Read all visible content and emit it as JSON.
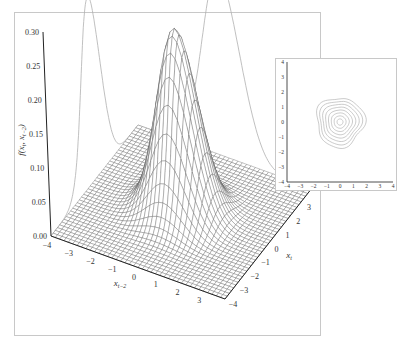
{
  "chart_data": [
    {
      "type": "surface3d",
      "title": "",
      "zlabel": "f(x_t, x_{t-2})",
      "xlabel": "x_{t-2}",
      "ylabel": "x_t",
      "x_range": [
        -4,
        4
      ],
      "y_range": [
        -4,
        4
      ],
      "z_range": [
        0.0,
        0.3
      ],
      "x_ticks": [
        -4,
        -3,
        -2,
        -1,
        0,
        1,
        2,
        3
      ],
      "y_ticks": [
        -4,
        -3,
        -2,
        -1,
        0,
        1,
        2,
        3
      ],
      "z_ticks": [
        "0.00",
        "0.05",
        "0.10",
        "0.15",
        "0.20",
        "0.25",
        "0.30"
      ],
      "surface": {
        "distribution": "bivariate normal-like density",
        "peak_value": 0.27,
        "peak_location": [
          0,
          0
        ],
        "sigma_x": 0.85,
        "sigma_y": 0.85
      },
      "grid_resolution": 40,
      "back_wall_projections": [
        {
          "name": "marginal projection on x_{t-2} wall",
          "peak_value": 0.27
        },
        {
          "name": "marginal projection on x_t wall",
          "peak_value": 0.27
        }
      ],
      "grid": false
    },
    {
      "type": "contour",
      "title": "",
      "x_range": [
        -4,
        4
      ],
      "y_range": [
        -4,
        4
      ],
      "x_ticks": [
        "-4",
        "-3",
        "-2",
        "-1",
        "0",
        "1",
        "2",
        "3",
        "4"
      ],
      "y_ticks": [
        "4",
        "3",
        "2",
        "1",
        "0",
        "-1",
        "-2",
        "-3",
        "-4"
      ],
      "center": [
        0,
        0
      ],
      "contour_levels": 8,
      "outer_contour_extent": {
        "x": [
          -1.8,
          1.8
        ],
        "y": [
          -1.6,
          1.7
        ]
      }
    }
  ],
  "main": {
    "z_tick_labels": [
      "0.00",
      "0.05",
      "0.10",
      "0.15",
      "0.20",
      "0.25",
      "0.30"
    ],
    "z_axis_label": "f(x",
    "x_tick_labels": [
      "-4",
      "-3",
      "-2",
      "-1",
      "0",
      "1",
      "2",
      "3"
    ],
    "y_tick_labels": [
      "-4",
      "-3",
      "-2",
      "-1",
      "0",
      "1",
      "2",
      "3"
    ]
  },
  "inset": {
    "x_tick_labels": [
      "-4",
      "-3",
      "-2",
      "-1",
      "0",
      "1",
      "2",
      "3",
      "4"
    ],
    "y_tick_labels": [
      "4",
      "3",
      "2",
      "1",
      "0",
      "-1",
      "-2",
      "-3",
      "-4"
    ]
  },
  "colors": {
    "frame": "#c8c8c8",
    "mesh": "#555555",
    "axis": "#222222",
    "projection": "#b0b0b0",
    "contour": "#a8a8a8",
    "text": "#333333"
  }
}
